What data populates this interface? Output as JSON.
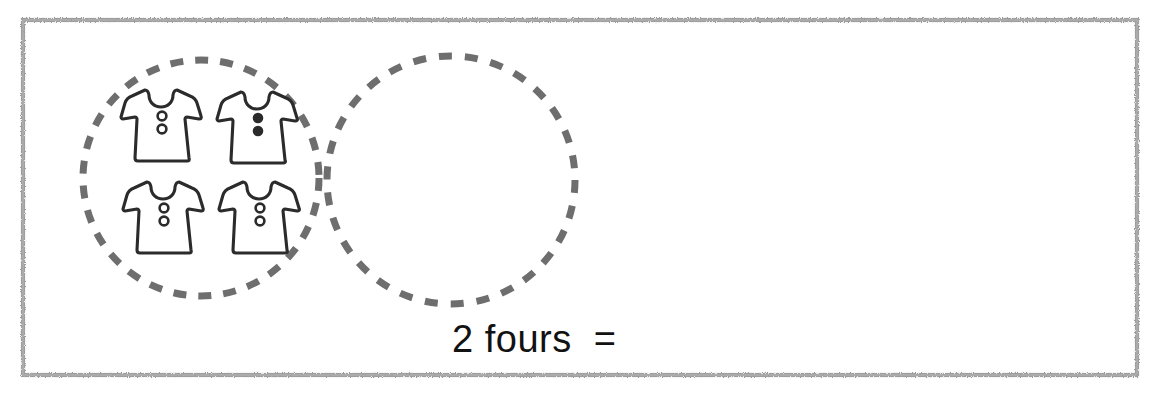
{
  "worksheet": {
    "title": "Multiplication grouping worksheet",
    "frame": {
      "stroke_color": "#9a9a9a"
    },
    "groups": [
      {
        "name": "group-one",
        "label": "group with four dresses",
        "dash_color": "#6e6e6e",
        "filled": true,
        "item_count": 4,
        "item_name": "dress",
        "items": [
          {
            "label": "dress",
            "button_style": "outline"
          },
          {
            "label": "dress",
            "button_style": "solid"
          },
          {
            "label": "dress",
            "button_style": "outline"
          },
          {
            "label": "dress",
            "button_style": "outline"
          }
        ]
      },
      {
        "name": "group-two",
        "label": "empty group to fill in",
        "dash_color": "#6e6e6e",
        "filled": false,
        "item_count": 0,
        "item_name": "dress",
        "items": []
      }
    ],
    "equation": {
      "text": "2 fours  =",
      "multiplier": "2",
      "group_word": "fours",
      "operator": "=",
      "answer": "",
      "color": "#121212"
    }
  }
}
